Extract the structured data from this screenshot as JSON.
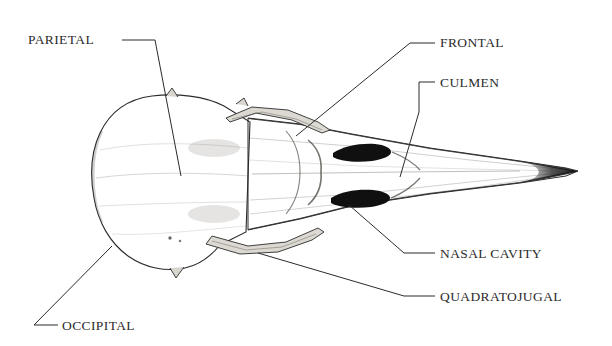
{
  "figure": {
    "kind": "anatomical-illustration",
    "style": "stipple engraving",
    "background_color": "#ffffff",
    "ink_color": "#2b2b2b",
    "bone_light": "#e8e6e2",
    "bone_mid": "#b9b5ae",
    "bone_dark": "#6d6a65",
    "cavity_color": "#141414"
  },
  "annotations": [
    {
      "id": "parietal",
      "text": "PARIETAL",
      "label_x": 28,
      "label_y": 33,
      "anchor": "start",
      "leader": "M 122 40 L 155 40 L 181 176",
      "target_x": 181,
      "target_y": 176
    },
    {
      "id": "frontal",
      "text": "FRONTAL",
      "label_x": 440,
      "label_y": 36,
      "anchor": "start",
      "leader": "M 435 43 L 410 43 L 296 136",
      "target_x": 296,
      "target_y": 136
    },
    {
      "id": "culmen",
      "text": "CULMEN",
      "label_x": 440,
      "label_y": 76,
      "anchor": "start",
      "leader": "M 435 82 L 419 82 L 419 112 L 400 177",
      "target_x": 400,
      "target_y": 177
    },
    {
      "id": "nasal-cavity",
      "text": "NASAL CAVITY",
      "label_x": 440,
      "label_y": 247,
      "anchor": "start",
      "leader": "M 435 253 L 404 253 L 349 205",
      "target_x": 349,
      "target_y": 205
    },
    {
      "id": "quadratojugal",
      "text": "QUADRATOJUGAL",
      "label_x": 440,
      "label_y": 290,
      "anchor": "start",
      "leader": "M 435 296 L 404 296 L 258 253",
      "target_x": 258,
      "target_y": 253
    },
    {
      "id": "occipital",
      "text": "OCCIPITAL",
      "label_x": 62,
      "label_y": 319,
      "anchor": "start",
      "leader": "M 58 325 L 34 325 L 112 246",
      "target_x": 112,
      "target_y": 246
    }
  ],
  "skull_geometry": {
    "cranium_outline": "M 152 96 C 128 99 110 112 100 133 C 91 152 90 176 94 198 C 98 222 110 243 128 256 C 145 268 166 272 185 268 C 199 265 211 256 220 245 L 246 232 L 250 122 L 224 106 C 205 96 176 93 152 96 Z",
    "beak_outline": "M 250 118 L 300 124 L 352 134 L 430 148 L 520 161 L 566 168 L 578 171 L 566 176 L 520 183 L 430 194 L 352 206 L 300 219 L 250 230 Z",
    "nasal_upper": "M 334 152 C 345 146 360 144 374 145 C 384 146 390 149 390 152 C 390 156 383 159 372 160 C 356 162 340 160 334 157 Z",
    "nasal_lower": "M 332 197 C 343 192 359 190 373 191 C 383 192 389 195 389 198 C 389 202 382 205 371 206 C 355 208 338 206 332 203 Z",
    "beak_tip": "M 540 163 L 578 171 L 540 180 C 548 175 548 168 540 163 Z",
    "culmen_ridge": "M 252 174 L 400 172 L 520 171",
    "jugal_bar_upper": "M 232 116 L 268 108 L 306 116 L 320 124",
    "jugal_bar_lower": "M 212 248 L 252 253 L 292 246 L 312 238"
  }
}
